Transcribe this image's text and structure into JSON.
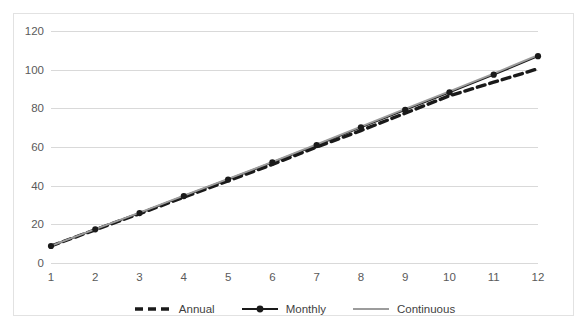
{
  "chart_data": {
    "type": "line",
    "title": "",
    "xlabel": "",
    "ylabel": "",
    "x": [
      1,
      2,
      3,
      4,
      5,
      6,
      7,
      8,
      9,
      10,
      11,
      12
    ],
    "categories": [
      "1",
      "2",
      "3",
      "4",
      "5",
      "6",
      "7",
      "8",
      "9",
      "10",
      "11",
      "12"
    ],
    "xlim": [
      1,
      12
    ],
    "ylim": [
      0,
      120
    ],
    "ytick_values": [
      0,
      20,
      40,
      60,
      80,
      100,
      120
    ],
    "yticks": [
      "0",
      "20",
      "40",
      "60",
      "80",
      "100",
      "120"
    ],
    "grid": "horizontal",
    "legend_position": "bottom",
    "series": [
      {
        "name": "Annual",
        "style": "dashed",
        "color": "#1a1a1a",
        "marker": "none",
        "values": [
          8.8,
          17.2,
          25.5,
          34.0,
          42.5,
          51.0,
          60.0,
          68.5,
          77.5,
          86.5,
          93.5,
          100.5
        ]
      },
      {
        "name": "Monthly",
        "style": "solid",
        "color": "#1a1a1a",
        "marker": "circle",
        "values": [
          8.8,
          17.4,
          25.8,
          34.6,
          43.2,
          52.0,
          61.0,
          70.2,
          79.2,
          88.3,
          97.4,
          107.0
        ]
      },
      {
        "name": "Continuous",
        "style": "solid",
        "color": "#9c9c9c",
        "marker": "none",
        "values": [
          8.9,
          17.5,
          26.0,
          34.8,
          43.5,
          52.3,
          61.4,
          70.6,
          79.7,
          88.8,
          98.0,
          107.5
        ]
      }
    ]
  },
  "legend": {
    "items": [
      {
        "label": "Annual"
      },
      {
        "label": "Monthly"
      },
      {
        "label": "Continuous"
      }
    ]
  },
  "colors": {
    "gridline": "#d9d9d9",
    "border": "#e2e2e2",
    "tick_text": "#5a5a5a",
    "annual": "#1a1a1a",
    "monthly": "#1a1a1a",
    "continuous": "#9c9c9c",
    "background": "#ffffff"
  }
}
